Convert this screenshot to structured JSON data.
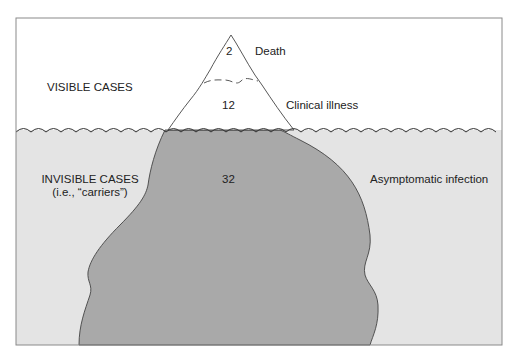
{
  "diagram": {
    "regions": {
      "above": "VISIBLE CASES",
      "below_line1": "INVISIBLE CASES",
      "below_line2": "(i.e., “carriers”)"
    },
    "layers": [
      {
        "value": "2",
        "label": "Death"
      },
      {
        "value": "12",
        "label": "Clinical illness"
      },
      {
        "value": "32",
        "label": "Asymptomatic infection"
      }
    ],
    "colors": {
      "sky": "#ffffff",
      "water": "#e4e4e4",
      "iceberg_submerged": "#a9a9a9",
      "iceberg_visible": "#ffffff",
      "outline": "#444444",
      "frame": "#8a8a8a"
    }
  }
}
